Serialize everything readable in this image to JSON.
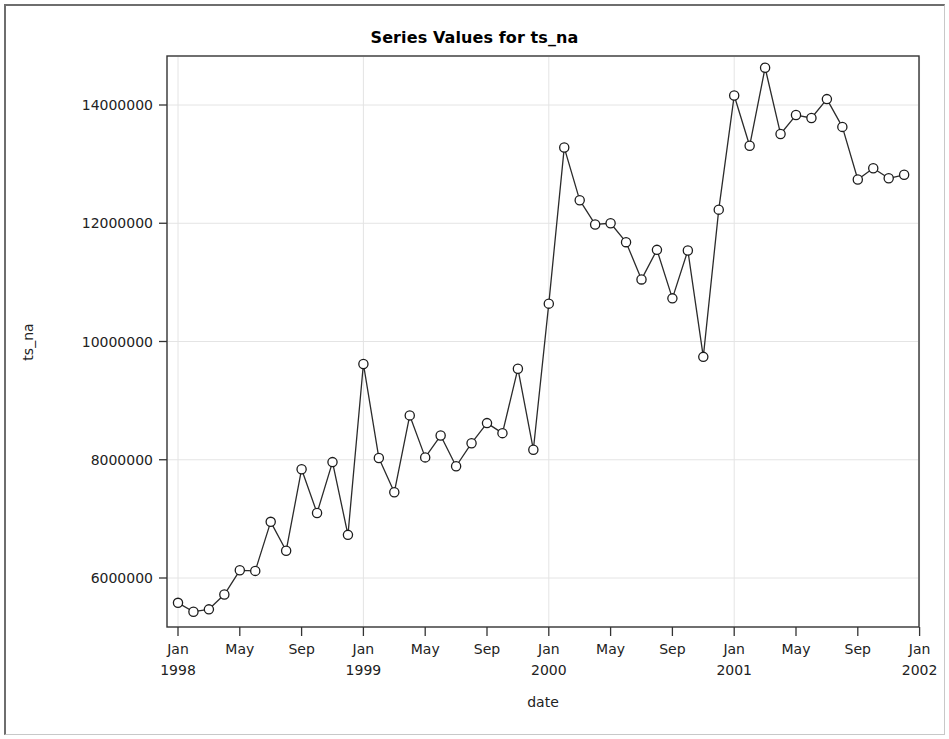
{
  "window": {
    "background_color": "#ffffff",
    "frame_color": "#6e6e6e"
  },
  "chart_data": {
    "type": "line",
    "title": "Series Values for ts_na",
    "xlabel": "date",
    "ylabel": "ts_na",
    "grid": true,
    "legend": "none",
    "marker": "open-circle",
    "line_color": "#2b2b2b",
    "marker_fill": "#ffffff",
    "ylim": [
      5200000,
      15000000
    ],
    "ytick_labels": [
      "6000000",
      "8000000",
      "10000000",
      "12000000",
      "14000000"
    ],
    "ytick_values": [
      6000000,
      8000000,
      10000000,
      12000000,
      14000000
    ],
    "xtick_labels": [
      {
        "month": "Jan",
        "year": "1998"
      },
      {
        "month": "May",
        "year": ""
      },
      {
        "month": "Sep",
        "year": ""
      },
      {
        "month": "Jan",
        "year": "1999"
      },
      {
        "month": "May",
        "year": ""
      },
      {
        "month": "Sep",
        "year": ""
      },
      {
        "month": "Jan",
        "year": "2000"
      },
      {
        "month": "May",
        "year": ""
      },
      {
        "month": "Sep",
        "year": ""
      },
      {
        "month": "Jan",
        "year": "2001"
      },
      {
        "month": "May",
        "year": ""
      },
      {
        "month": "Sep",
        "year": ""
      },
      {
        "month": "Jan",
        "year": "2002"
      }
    ],
    "x": [
      "1998-01",
      "1998-02",
      "1998-03",
      "1998-04",
      "1998-05",
      "1998-06",
      "1998-07",
      "1998-08",
      "1998-09",
      "1998-10",
      "1998-11",
      "1998-12",
      "1999-01",
      "1999-02",
      "1999-03",
      "1999-04",
      "1999-05",
      "1999-06",
      "1999-07",
      "1999-08",
      "1999-09",
      "1999-10",
      "1999-11",
      "1999-12",
      "2000-01",
      "2000-02",
      "2000-03",
      "2000-04",
      "2000-05",
      "2000-06",
      "2000-07",
      "2000-08",
      "2000-09",
      "2000-10",
      "2000-11",
      "2000-12",
      "2001-01",
      "2001-02",
      "2001-03",
      "2001-04",
      "2001-05",
      "2001-06",
      "2001-07",
      "2001-08",
      "2001-09",
      "2001-10",
      "2001-11",
      "2001-12"
    ],
    "values": [
      5580000,
      5430000,
      5470000,
      5720000,
      6130000,
      6120000,
      6950000,
      6460000,
      7840000,
      7100000,
      7960000,
      6730000,
      9620000,
      8030000,
      7450000,
      8750000,
      8040000,
      8410000,
      7890000,
      8280000,
      8620000,
      8450000,
      9540000,
      8170000,
      10640000,
      13280000,
      12390000,
      11980000,
      12000000,
      11680000,
      11050000,
      11550000,
      10730000,
      11540000,
      9740000,
      12230000,
      14160000,
      13310000,
      14630000,
      13510000,
      13830000,
      13780000,
      14100000,
      13630000,
      12740000,
      12930000,
      12760000,
      12820000
    ]
  }
}
